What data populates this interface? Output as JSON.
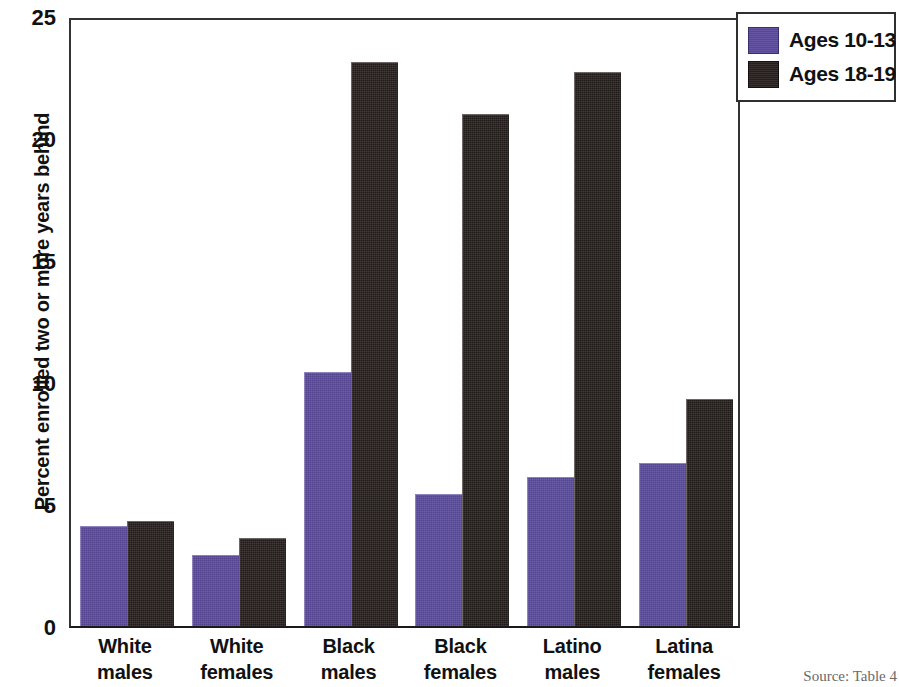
{
  "chart_data": {
    "type": "bar",
    "title": "",
    "xlabel": "",
    "ylabel": "Percent enrolled two or more years behind",
    "ylim": [
      0,
      25
    ],
    "yticks": [
      0,
      5,
      10,
      15,
      20,
      25
    ],
    "ytick_labels": [
      "0",
      "5",
      "10",
      "15",
      "20",
      "25"
    ],
    "grid": false,
    "legend_position": "top-right-outside",
    "categories": [
      "White males",
      "White females",
      "Black males",
      "Black females",
      "Latino males",
      "Latina females"
    ],
    "category_lines": [
      [
        "White",
        "males"
      ],
      [
        "White",
        "females"
      ],
      [
        "Black",
        "males"
      ],
      [
        "Black",
        "females"
      ],
      [
        "Latino",
        "males"
      ],
      [
        "Latina",
        "females"
      ]
    ],
    "series": [
      {
        "name": "Ages 10-13",
        "color": "#5c4b9e",
        "values": [
          4.1,
          2.9,
          10.4,
          5.4,
          6.1,
          6.7
        ]
      },
      {
        "name": "Ages 18-19",
        "color": "#2a2220",
        "values": [
          4.3,
          3.6,
          23.1,
          21.0,
          22.7,
          9.3
        ]
      }
    ]
  },
  "legend": {
    "items": [
      {
        "label": "Ages 10-13",
        "swatch": "purple"
      },
      {
        "label": "Ages 18-19",
        "swatch": "dark"
      }
    ]
  },
  "axis": {
    "y_title": "Percent enrolled two or more years behind"
  },
  "footer": {
    "source": "Source: Table 4"
  }
}
